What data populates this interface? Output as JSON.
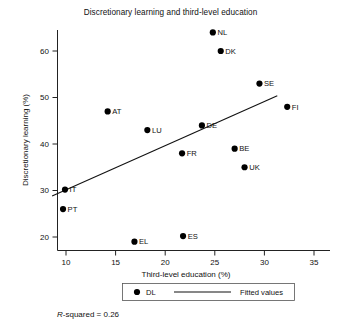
{
  "chart_data": {
    "type": "scatter",
    "title": "Discretionary learning and third-level education",
    "xlabel": "Third-level education (%)",
    "ylabel": "Discretionary learning (%)",
    "xlim": [
      8.2,
      33.8
    ],
    "ylim": [
      17.0,
      65.0
    ],
    "xticks": [
      10,
      15,
      20,
      25,
      30,
      35
    ],
    "yticks": [
      20,
      30,
      40,
      50,
      60
    ],
    "xtick_labels": [
      "10",
      "15",
      "20",
      "25",
      "30",
      "35"
    ],
    "ytick_labels": [
      "20",
      "30",
      "40",
      "50",
      "60"
    ],
    "grid": false,
    "legend_position": "below-axis",
    "series": [
      {
        "name": "DL",
        "marker": "filled-circle",
        "color": "#000000",
        "points": [
          {
            "label": "NL",
            "x": 24.8,
            "y": 64.0,
            "label_side": "right"
          },
          {
            "label": "DK",
            "x": 25.6,
            "y": 60.0,
            "label_side": "right"
          },
          {
            "label": "SE",
            "x": 29.5,
            "y": 53.0,
            "label_side": "right"
          },
          {
            "label": "FI",
            "x": 32.3,
            "y": 48.0,
            "label_side": "right"
          },
          {
            "label": "AT",
            "x": 14.2,
            "y": 47.0,
            "label_side": "right"
          },
          {
            "label": "DE",
            "x": 23.7,
            "y": 44.0,
            "label_side": "right"
          },
          {
            "label": "LU",
            "x": 18.2,
            "y": 43.0,
            "label_side": "right"
          },
          {
            "label": "BE",
            "x": 27.0,
            "y": 39.0,
            "label_side": "right"
          },
          {
            "label": "FR",
            "x": 21.7,
            "y": 38.0,
            "label_side": "right"
          },
          {
            "label": "UK",
            "x": 28.0,
            "y": 35.0,
            "label_side": "right"
          },
          {
            "label": "IT",
            "x": 9.9,
            "y": 30.2,
            "label_side": "right"
          },
          {
            "label": "PT",
            "x": 9.7,
            "y": 26.0,
            "label_side": "right"
          },
          {
            "label": "ES",
            "x": 21.8,
            "y": 20.2,
            "label_side": "right"
          },
          {
            "label": "EL",
            "x": 16.9,
            "y": 19.0,
            "label_side": "right"
          }
        ]
      }
    ],
    "fitted_line": {
      "name": "Fitted values",
      "x_start": 8.6,
      "y_start": 28.8,
      "x_end": 31.3,
      "y_end": 50.4
    },
    "annotations": [
      {
        "name": "r-squared",
        "prefix_italic": "R",
        "text": "-squared = 0.26"
      }
    ],
    "legend": {
      "marker_label": "DL",
      "line_label": "Fitted values"
    }
  }
}
